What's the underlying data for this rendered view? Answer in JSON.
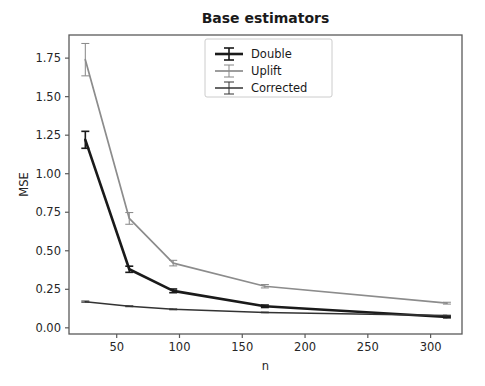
{
  "chart_data": {
    "type": "line",
    "title": "Base estimators",
    "xlabel": "n",
    "ylabel": "MSE",
    "grid": false,
    "legend_position": "upper center",
    "xlim": [
      12,
      325
    ],
    "ylim": [
      -0.04,
      1.9
    ],
    "xticks": [
      50,
      100,
      150,
      200,
      250,
      300
    ],
    "xtick_labels": [
      "50",
      "100",
      "150",
      "200",
      "250",
      "300"
    ],
    "yticks": [
      0.0,
      0.25,
      0.5,
      0.75,
      1.0,
      1.25,
      1.5,
      1.75
    ],
    "ytick_labels": [
      "0.00",
      "0.25",
      "0.50",
      "0.75",
      "1.00",
      "1.25",
      "1.50",
      "1.75"
    ],
    "x": [
      25,
      60,
      95,
      168,
      313
    ],
    "series": [
      {
        "name": "Double",
        "color": "#1a1a1a",
        "linewidth": 2.6,
        "values": [
          1.22,
          0.38,
          0.24,
          0.14,
          0.07
        ],
        "errors": [
          0.055,
          0.02,
          0.012,
          0.008,
          0.005
        ]
      },
      {
        "name": "Uplift",
        "color": "#8c8c8c",
        "linewidth": 1.7,
        "values": [
          1.74,
          0.71,
          0.42,
          0.27,
          0.16
        ],
        "errors": [
          0.105,
          0.038,
          0.018,
          0.011,
          0.006
        ]
      },
      {
        "name": "Corrected",
        "color": "#333333",
        "linewidth": 1.5,
        "values": [
          0.17,
          0.14,
          0.12,
          0.1,
          0.08
        ],
        "errors": [
          0.004,
          0.003,
          0.003,
          0.002,
          0.002
        ]
      }
    ]
  },
  "legend": {
    "items": [
      {
        "label": "Double"
      },
      {
        "label": "Uplift"
      },
      {
        "label": "Corrected"
      }
    ]
  },
  "colors": {
    "background": "#ffffff",
    "axis": "#5a5a5a",
    "text": "#262626",
    "double": "#1a1a1a",
    "uplift": "#8c8c8c",
    "corrected": "#333333"
  }
}
